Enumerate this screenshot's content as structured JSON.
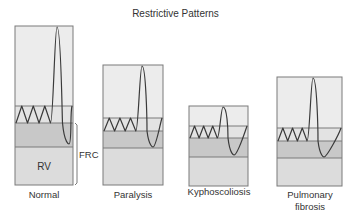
{
  "title": "Restrictive Patterns",
  "frc_label": "FRC",
  "rv_label": "RV",
  "colors": {
    "upper": "#ececec",
    "tidal": "#e3e3e3",
    "erv": "#c8c8c8",
    "rv": "#dcdcdc",
    "border": "#7a7a7a",
    "trace": "#3a3a3a"
  },
  "panels": [
    {
      "label": "Normal",
      "box": {
        "x": 15,
        "y": 26,
        "w": 58,
        "bottom": 185
      },
      "lines": {
        "tidal_top": 106,
        "frc": 123,
        "rv_top": 147
      },
      "peak": {
        "x": 57,
        "y": 27
      },
      "trough": {
        "x": 68,
        "y": 144
      }
    },
    {
      "label": "Paralysis",
      "box": {
        "x": 103,
        "y": 65,
        "w": 60,
        "bottom": 185
      },
      "lines": {
        "tidal_top": 118,
        "frc": 131,
        "rv_top": 148
      },
      "peak": {
        "x": 142,
        "y": 66
      },
      "trough": {
        "x": 152,
        "y": 147
      }
    },
    {
      "label": "Kyphoscoliosis",
      "box": {
        "x": 189,
        "y": 106,
        "w": 59,
        "bottom": 186
      },
      "lines": {
        "tidal_top": 126,
        "frc": 138,
        "rv_top": 157
      },
      "peak": {
        "x": 223,
        "y": 107
      },
      "trough": {
        "x": 233,
        "y": 155
      }
    },
    {
      "label": "Pulmonary\nfibrosis",
      "label_lines": [
        "Pulmonary",
        "fibrosis"
      ],
      "box": {
        "x": 277,
        "y": 77,
        "w": 65,
        "bottom": 186
      },
      "lines": {
        "tidal_top": 128,
        "frc": 141,
        "rv_top": 158
      },
      "peak": {
        "x": 313,
        "y": 78
      },
      "trough": {
        "x": 323,
        "y": 157
      }
    }
  ]
}
